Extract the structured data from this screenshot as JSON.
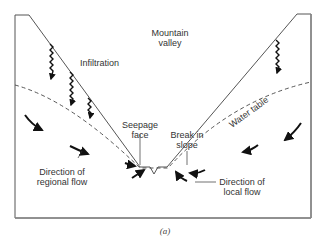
{
  "figure": {
    "caption": "(a)",
    "labels": {
      "mountain_valley_line1": "Mountain",
      "mountain_valley_line2": "valley",
      "infiltration": "Infiltration",
      "water_table": "Water table",
      "seepage_face_line1": "Seepage",
      "seepage_face_line2": "face",
      "break_in_slope_line1": "Break in",
      "break_in_slope_line2": "slope",
      "regional_flow_line1": "Direction of",
      "regional_flow_line2": "regional flow",
      "local_flow_line1": "Direction of",
      "local_flow_line2": "local flow"
    },
    "colors": {
      "line": "#333333",
      "frame": "#888888",
      "arrow": "#111111"
    }
  }
}
